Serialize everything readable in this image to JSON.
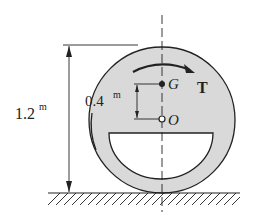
{
  "diagram": {
    "height_label": "1.2",
    "height_unit": "m",
    "offset_label": "0.4",
    "offset_unit": "m",
    "point_g": "G",
    "point_o": "O",
    "torque_label": "T",
    "colors": {
      "fill": "#d9d9d9",
      "stroke": "#222222",
      "background": "#ffffff"
    }
  }
}
